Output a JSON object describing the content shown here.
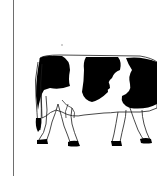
{
  "image": {
    "subject": "holstein-cow-illustration",
    "description": "Black and white line drawing of a Holstein cow facing right, head cropped off at right edge",
    "colors": {
      "background": "#ffffff",
      "spots": "#000000",
      "outline": "#1a1a1a",
      "frame_line": "#6e6e6e"
    }
  }
}
